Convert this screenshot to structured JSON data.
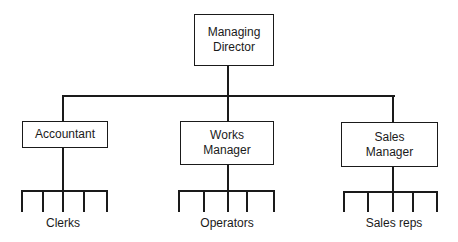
{
  "diagram": {
    "type": "organisation-chart",
    "root": {
      "label": "Managing Director",
      "line1": "Managing",
      "line2": "Director"
    },
    "departments": [
      {
        "label": "Accountant",
        "line1": "Accountant",
        "subordinates": "Clerks",
        "subordinate_count": 5
      },
      {
        "label": "Works Manager",
        "line1": "Works",
        "line2": "Manager",
        "subordinates": "Operators",
        "subordinate_count": 5
      },
      {
        "label": "Sales Manager",
        "line1": "Sales",
        "line2": "Manager",
        "subordinates": "Sales reps",
        "subordinate_count": 5
      }
    ]
  }
}
